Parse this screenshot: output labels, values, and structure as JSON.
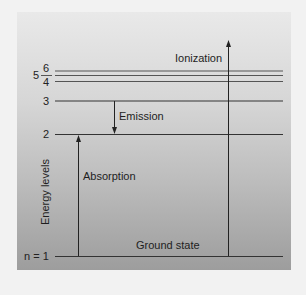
{
  "diagram": {
    "title": "",
    "axis_label": "Energy levels",
    "levels": [
      {
        "n": "n = 1",
        "label": "Ground state"
      },
      {
        "n": "2"
      },
      {
        "n": "3"
      },
      {
        "n": "4"
      },
      {
        "n": "5"
      },
      {
        "n": "6"
      }
    ],
    "transitions": {
      "ionization": "Ionization",
      "emission": "Emission",
      "absorption": "Absorption"
    },
    "colors": {
      "panel_top": "#e9e9e9",
      "panel_bottom": "#9d9d9d",
      "line": "#333333",
      "upper_lines": "#555555"
    }
  }
}
